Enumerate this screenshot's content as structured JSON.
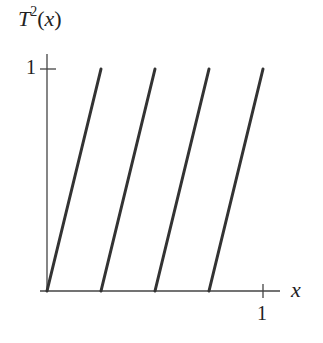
{
  "chart_data": {
    "type": "line",
    "title": "",
    "xlabel": "x",
    "ylabel": "T^2(x)",
    "ylabel_parts": {
      "base": "T",
      "exp": "2",
      "arg": "(x)"
    },
    "x_ticks": [
      "1"
    ],
    "y_ticks": [
      "1"
    ],
    "xlim": [
      0,
      1
    ],
    "ylim": [
      0,
      1
    ],
    "grid": false,
    "legend": null,
    "series": [
      {
        "name": "segment 1",
        "x": [
          0,
          0.25
        ],
        "y": [
          0,
          1
        ]
      },
      {
        "name": "segment 2",
        "x": [
          0.25,
          0.5
        ],
        "y": [
          0,
          1
        ]
      },
      {
        "name": "segment 3",
        "x": [
          0.5,
          0.75
        ],
        "y": [
          0,
          1
        ]
      },
      {
        "name": "segment 4",
        "x": [
          0.75,
          1.0
        ],
        "y": [
          0,
          1
        ]
      }
    ]
  },
  "labels": {
    "y_base": "T",
    "y_exp": "2",
    "y_arg": "(x)",
    "x_axis": "x",
    "y_tick": "1",
    "x_tick": "1"
  }
}
